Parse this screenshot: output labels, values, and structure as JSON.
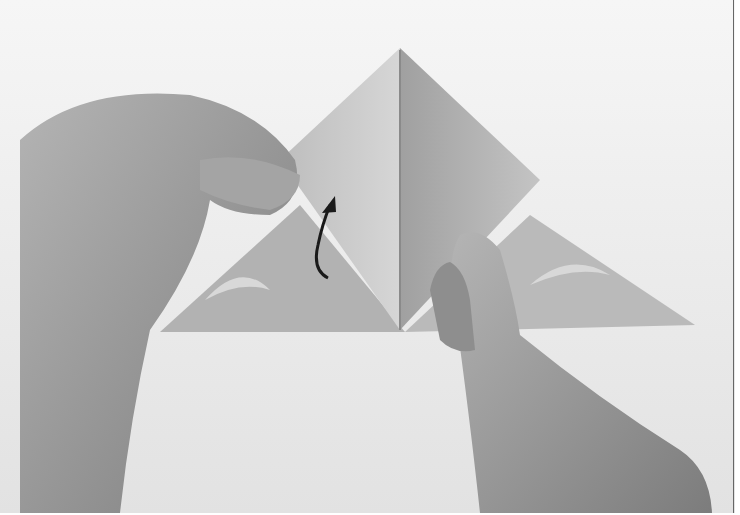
{
  "image": {
    "subject": "Hands folding origami paper into a triangle",
    "annotation": "curved-arrow-up",
    "colors": {
      "background": "#ffffff",
      "table": "#ececec",
      "paper": "#c8c8c8",
      "paper_dark": "#a8a8a8",
      "skin": "#9a9a9a",
      "arrow": "#1a1a1a"
    }
  }
}
